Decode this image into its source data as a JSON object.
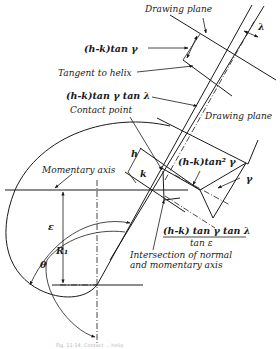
{
  "diagram": {
    "type": "technical-drawing",
    "labels": {
      "drawing_plane_top": "Drawing plane",
      "lambda_top": "λ",
      "hk_tan_gamma": "(h-k)tan γ",
      "tangent_to_helix": "Tangent to helix",
      "hk_tan_gamma_tan_lambda": "(h-k)tan γ tan λ",
      "contact_point": "Contact point",
      "drawing_plane_right": "Drawing plane",
      "h": "h",
      "k": "k",
      "hk_tan2_gamma": "(h-k)tan² γ",
      "gamma": "γ",
      "momentary_axis": "Momentary axis",
      "epsilon": "ε",
      "r1": "R₁",
      "theta": "θ",
      "fraction_numerator": "(h-k) tan γ tan λ",
      "fraction_denominator": "tan ε",
      "intersection_line1": "Intersection of normal",
      "intersection_line2": "and momentary axis"
    },
    "caption": "Fig. 11-14. Contact ... helix"
  }
}
